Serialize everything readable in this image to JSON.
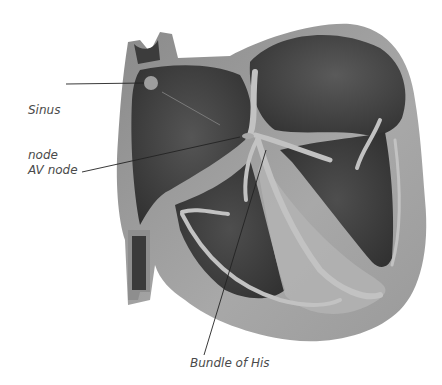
{
  "diagram": {
    "labels": {
      "sinus_node_line1": "Sinus",
      "sinus_node_line2": "node",
      "av_node": "AV node",
      "bundle_of_his": "Bundle of His"
    },
    "colors": {
      "background": "#ffffff",
      "wall": "#9a9a9a",
      "wall_light": "#b4b4b4",
      "chamber_dark": "#3e3e3e",
      "chamber_mid": "#545454",
      "conduction": "#bdbdbd",
      "leader_line": "#222222",
      "label_text": "#4a4a4a"
    }
  }
}
